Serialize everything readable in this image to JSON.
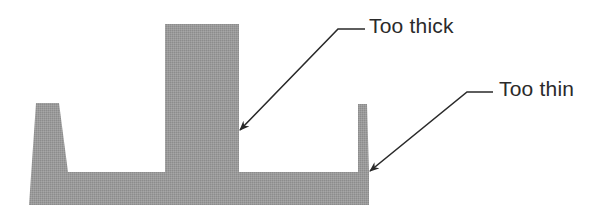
{
  "figure": {
    "type": "cross-section wall thickness diagram",
    "shape_fill": "#999999",
    "shape_texture": "#8a8a8a",
    "line_color": "#2a2a2a",
    "background": "#ffffff"
  },
  "callouts": [
    {
      "id": "thick",
      "label": "Too thick",
      "target": "center-rib"
    },
    {
      "id": "thin",
      "label": "Too thin",
      "target": "right-wall"
    }
  ],
  "parts": {
    "left_wall": "tapered left wall (acceptable thickness)",
    "center_rib": "thick center rib",
    "right_wall": "thin right wall",
    "base": "base plate"
  }
}
